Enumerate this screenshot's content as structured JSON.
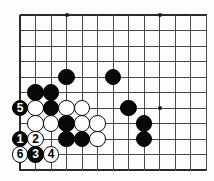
{
  "diagram": {
    "type": "go-board-problem",
    "board": {
      "cell": 15.5,
      "origin_x": 20,
      "origin_y": 15,
      "cols": 13,
      "rows": 11,
      "stone_radius": 8.2,
      "line_color": "#4a4a4a",
      "edge_color": "#2b2b2b",
      "background": "#fdfdfd",
      "black_color": "#080808",
      "white_color": "#ffffff"
    },
    "star_points": [
      {
        "col": 3,
        "row": 0
      },
      {
        "col": 9,
        "row": 0
      },
      {
        "col": 9,
        "row": 6
      }
    ],
    "stones": [
      {
        "col": 3,
        "row": 4,
        "color": "black",
        "label": ""
      },
      {
        "col": 6,
        "row": 4,
        "color": "black",
        "label": ""
      },
      {
        "col": 1,
        "row": 5,
        "color": "black",
        "label": ""
      },
      {
        "col": 2,
        "row": 5,
        "color": "black",
        "label": ""
      },
      {
        "col": 0,
        "row": 6,
        "color": "black",
        "label": "5"
      },
      {
        "col": 1,
        "row": 6,
        "color": "white",
        "label": ""
      },
      {
        "col": 2,
        "row": 6,
        "color": "black",
        "label": ""
      },
      {
        "col": 3,
        "row": 6,
        "color": "white",
        "label": ""
      },
      {
        "col": 4,
        "row": 6,
        "color": "white",
        "label": ""
      },
      {
        "col": 7,
        "row": 6,
        "color": "black",
        "label": ""
      },
      {
        "col": 1,
        "row": 7,
        "color": "white",
        "label": ""
      },
      {
        "col": 2,
        "row": 7,
        "color": "white",
        "label": ""
      },
      {
        "col": 3,
        "row": 7,
        "color": "black",
        "label": ""
      },
      {
        "col": 4,
        "row": 7,
        "color": "white",
        "label": ""
      },
      {
        "col": 5,
        "row": 7,
        "color": "white",
        "label": ""
      },
      {
        "col": 8,
        "row": 7,
        "color": "black",
        "label": ""
      },
      {
        "col": 0,
        "row": 8,
        "color": "black",
        "label": "1"
      },
      {
        "col": 1,
        "row": 8,
        "color": "white",
        "label": "2"
      },
      {
        "col": 3,
        "row": 8,
        "color": "black",
        "label": ""
      },
      {
        "col": 4,
        "row": 8,
        "color": "black",
        "label": ""
      },
      {
        "col": 5,
        "row": 8,
        "color": "white",
        "label": ""
      },
      {
        "col": 8,
        "row": 8,
        "color": "black",
        "label": ""
      },
      {
        "col": 0,
        "row": 9,
        "color": "white",
        "label": "6"
      },
      {
        "col": 1,
        "row": 9,
        "color": "black",
        "label": "3"
      },
      {
        "col": 2,
        "row": 9,
        "color": "white",
        "label": "4"
      }
    ],
    "move_numbers": [
      "1",
      "2",
      "3",
      "4",
      "5",
      "6"
    ]
  }
}
